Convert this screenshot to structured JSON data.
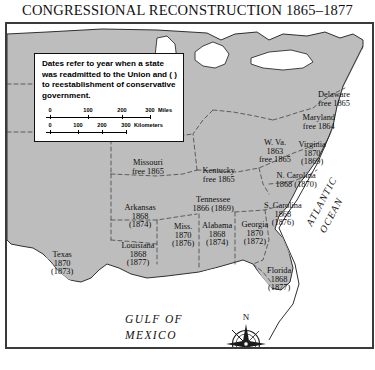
{
  "title": "CONGRESSIONAL RECONSTRUCTION 1865–1877",
  "legend": {
    "note": "Dates refer to year when a state was readmitted to the Union and ( ) to reestablishment of conservative government.",
    "scales": [
      {
        "unit": "Miles",
        "ticks": [
          "0",
          "100",
          "200",
          "300"
        ]
      },
      {
        "unit": "Kilometers",
        "ticks": [
          "0",
          "100",
          "200",
          "300"
        ]
      }
    ]
  },
  "water_labels": {
    "gulf_line1": "GULF OF",
    "gulf_line2": "MEXICO",
    "atlantic_line1": "ATLANTIC",
    "atlantic_line2": "OCEAN"
  },
  "compass": {
    "north": "N"
  },
  "colors": {
    "land": "#bdbdbd",
    "water": "#ffffff",
    "border": "#3a3a3a",
    "state_line": "#4a4a4a",
    "text": "#0d0d0d"
  },
  "states": [
    {
      "name": "Missouri",
      "lines": [
        "Missouri",
        "free 1865"
      ],
      "x": 141,
      "y": 135
    },
    {
      "name": "Kentucky",
      "lines": [
        "Kentucky",
        "free 1865"
      ],
      "x": 212,
      "y": 143
    },
    {
      "name": "Tennessee",
      "lines": [
        "Tennessee",
        "1866 (1869)"
      ],
      "x": 206,
      "y": 172
    },
    {
      "name": "Arkansas",
      "lines": [
        "Arkansas",
        "1868",
        "(1874)"
      ],
      "x": 133,
      "y": 180
    },
    {
      "name": "Mississippi",
      "lines": [
        "Miss.",
        "1870",
        "(1876)"
      ],
      "x": 176,
      "y": 199
    },
    {
      "name": "Alabama",
      "lines": [
        "Alabama",
        "1868",
        "(1874)"
      ],
      "x": 210,
      "y": 198
    },
    {
      "name": "Georgia",
      "lines": [
        "Georgia",
        "1870",
        "(1872)"
      ],
      "x": 248,
      "y": 197
    },
    {
      "name": "Louisiana",
      "lines": [
        "Louisiana",
        "1868",
        "(1877)"
      ],
      "x": 131,
      "y": 218
    },
    {
      "name": "Texas",
      "lines": [
        "Texas",
        "1870",
        "(1873)"
      ],
      "x": 55,
      "y": 227
    },
    {
      "name": "Florida",
      "lines": [
        "Florida",
        "1868",
        "(1877)"
      ],
      "x": 272,
      "y": 243
    },
    {
      "name": "South Carolina",
      "lines": [
        "S. Carolina",
        "1868",
        "(1876)"
      ],
      "x": 276,
      "y": 178
    },
    {
      "name": "North Carolina",
      "lines": [
        "N. Carolina",
        "1868 (1870)"
      ],
      "x": 289,
      "y": 148
    },
    {
      "name": "Virginia",
      "lines": [
        "Virginia",
        "1870",
        "(1869)"
      ],
      "x": 305,
      "y": 117
    },
    {
      "name": "West Virginia",
      "lines": [
        "W. Va.",
        "1863",
        "free 1865"
      ],
      "x": 268,
      "y": 115
    },
    {
      "name": "Maryland",
      "lines": [
        "Maryland",
        "free 1864"
      ],
      "x": 312,
      "y": 90
    },
    {
      "name": "Delaware",
      "lines": [
        "Delaware",
        "free 1865"
      ],
      "x": 327,
      "y": 67
    }
  ]
}
